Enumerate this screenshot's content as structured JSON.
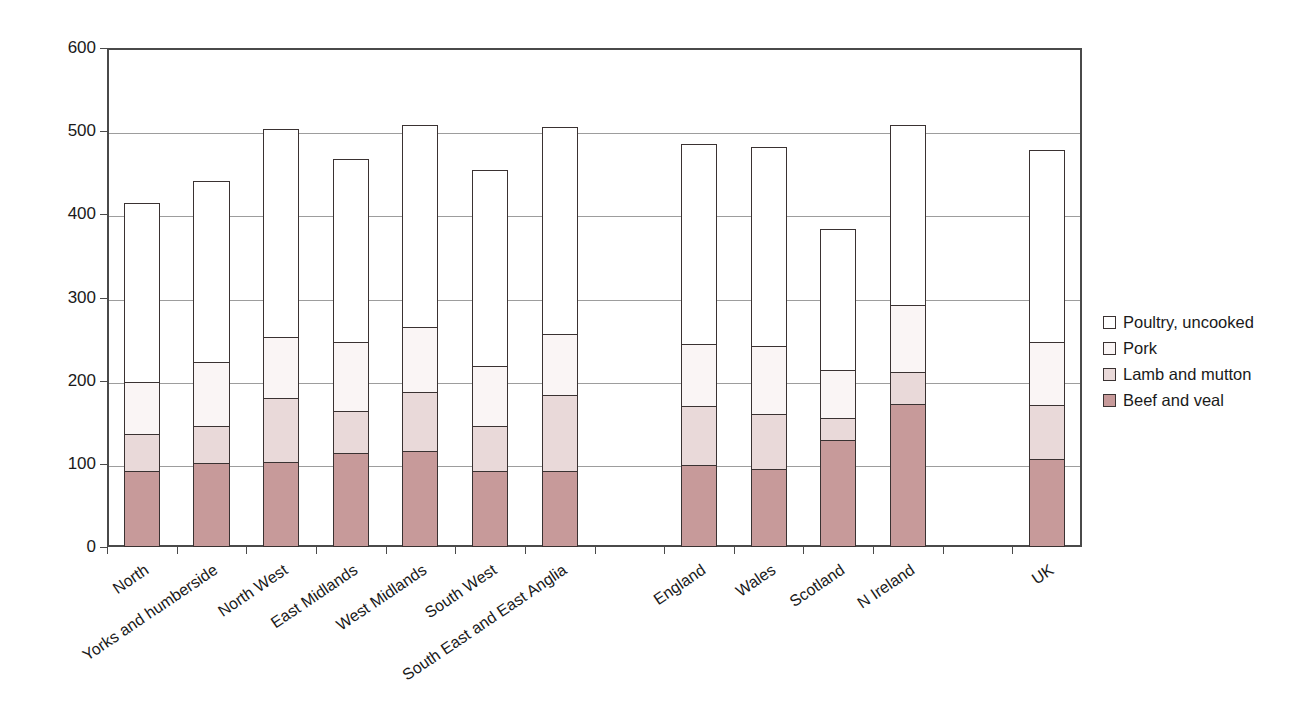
{
  "chart_data": {
    "type": "bar",
    "subtype": "stacked-column",
    "title": "",
    "subtitle": "",
    "xlabel": "",
    "ylabel": "",
    "ylim": [
      0,
      600
    ],
    "ytick_values": [
      0,
      100,
      200,
      300,
      400,
      500,
      600
    ],
    "ytick_labels": [
      "0",
      "100",
      "200",
      "300",
      "400",
      "500",
      "600"
    ],
    "grid": true,
    "legend_position": "right",
    "categories": [
      "North",
      "Yorks and humberside",
      "North West",
      "East Midlands",
      "West Midlands",
      "South West",
      "South East and East Anglia",
      "",
      "England",
      "Wales",
      "Scotland",
      "N Ireland",
      "",
      "UK"
    ],
    "series": [
      {
        "name": "Beef and veal",
        "color": "#c79a9a",
        "values": [
          92,
          101,
          102,
          113,
          116,
          91,
          92,
          null,
          99,
          94,
          129,
          172,
          null,
          106
        ]
      },
      {
        "name": "Lamb and mutton",
        "color": "#e9d9d9",
        "values": [
          44,
          45,
          77,
          51,
          70,
          54,
          91,
          null,
          71,
          66,
          26,
          39,
          null,
          65
        ]
      },
      {
        "name": "Pork",
        "color": "#faf5f5",
        "values": [
          62,
          76,
          74,
          82,
          79,
          73,
          73,
          null,
          74,
          82,
          58,
          80,
          null,
          76
        ]
      },
      {
        "name": "Poultry, uncooked",
        "color": "#ffffff",
        "values": [
          216,
          218,
          250,
          220,
          243,
          235,
          249,
          null,
          240,
          239,
          169,
          217,
          null,
          230
        ]
      }
    ],
    "totals": [
      414,
      440,
      503,
      466,
      508,
      453,
      505,
      null,
      484,
      481,
      382,
      508,
      null,
      477
    ],
    "legend_order": [
      "Poultry, uncooked",
      "Pork",
      "Lamb and mutton",
      "Beef and veal"
    ],
    "axis_color": "#4a4a4a",
    "grid_color": "#9d9d9d",
    "bar_outline_color": "#3a3232"
  }
}
